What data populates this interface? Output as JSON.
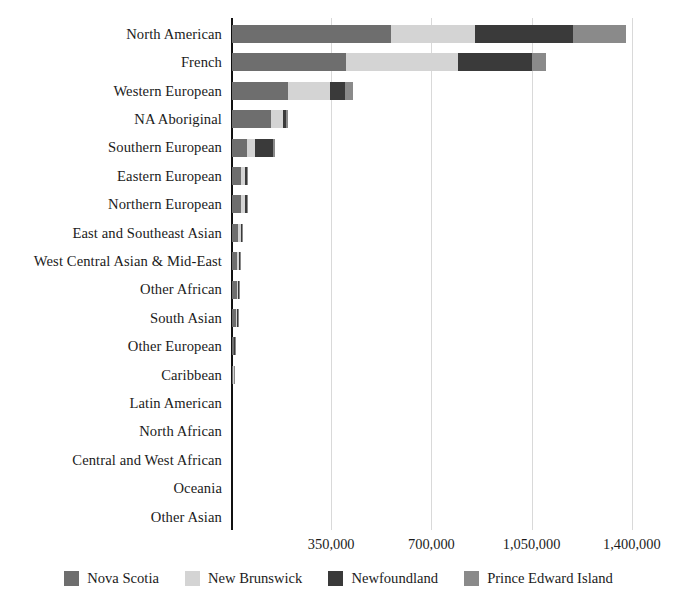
{
  "chart_data": {
    "type": "bar",
    "orientation": "horizontal",
    "stacked": true,
    "title": "",
    "subtitle": "",
    "xlabel": "",
    "ylabel": "",
    "xlim": [
      0,
      1550000
    ],
    "xticks": [
      350000,
      700000,
      1050000,
      1400000
    ],
    "xtick_labels": [
      "350,000",
      "700,000",
      "1,050,000",
      "1,400,000"
    ],
    "grid": true,
    "grid_axis": "x",
    "legend_position": "bottom",
    "categories": [
      "North American",
      "French",
      "Western European",
      "NA Aboriginal",
      "Southern European",
      "Eastern European",
      "Northern European",
      "East and Southeast Asian",
      "West Central Asian & Mid-East",
      "Other African",
      "South Asian",
      "Other European",
      "Caribbean",
      "Latin American",
      "North African",
      "Central and West African",
      "Oceania",
      "Other Asian"
    ],
    "series": [
      {
        "name": "Nova Scotia",
        "color": "#6e6e6e",
        "values": [
          555000,
          397000,
          194000,
          135000,
          52000,
          30000,
          30000,
          22000,
          18000,
          16000,
          13000,
          6000,
          5000,
          0,
          0,
          0,
          0,
          0
        ]
      },
      {
        "name": "New Brunswick",
        "color": "#d4d4d4",
        "values": [
          295000,
          392000,
          150000,
          42000,
          28000,
          14000,
          14000,
          9000,
          7000,
          6000,
          5000,
          2000,
          2000,
          0,
          0,
          0,
          0,
          0
        ]
      },
      {
        "name": "Newfoundland",
        "color": "#3a3a3a",
        "values": [
          340000,
          259000,
          52000,
          11000,
          63000,
          7000,
          7000,
          5000,
          4000,
          3000,
          2000,
          1000,
          1000,
          0,
          0,
          0,
          0,
          0
        ]
      },
      {
        "name": "Prince Edward Island",
        "color": "#8a8a8a",
        "values": [
          188000,
          49000,
          28000,
          7000,
          9000,
          3000,
          3000,
          2000,
          2000,
          1000,
          1000,
          500,
          500,
          0,
          0,
          0,
          0,
          0
        ]
      }
    ],
    "totals": [
      1378000,
      1097000,
      424000,
      195000,
      152000,
      54000,
      54000,
      38000,
      31000,
      26000,
      21000,
      9500,
      8500,
      0,
      0,
      0,
      0,
      0
    ]
  },
  "legend": {
    "items": [
      {
        "label": "Nova Scotia",
        "color": "#6e6e6e"
      },
      {
        "label": "New Brunswick",
        "color": "#d4d4d4"
      },
      {
        "label": "Newfoundland",
        "color": "#3a3a3a"
      },
      {
        "label": "Prince Edward Island",
        "color": "#8a8a8a"
      }
    ]
  }
}
